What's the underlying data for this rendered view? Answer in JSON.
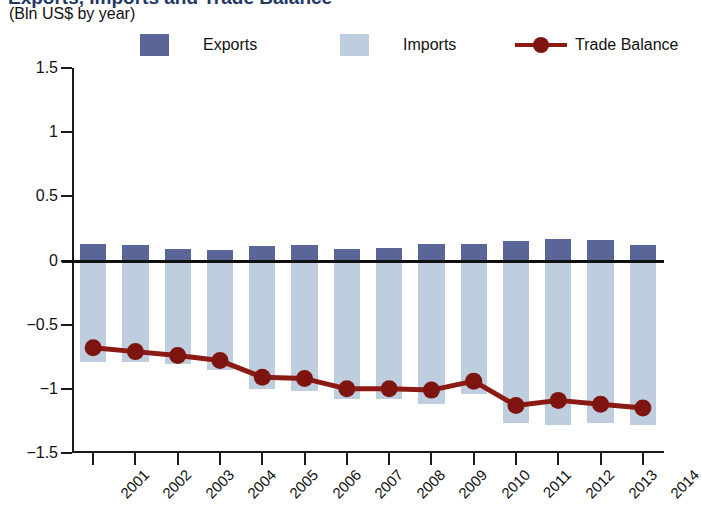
{
  "header": {
    "title": "Exports, Imports and Trade Balance",
    "subtitle": "(Bln US$ by year)"
  },
  "legend": {
    "exports_label": "Exports",
    "imports_label": "Imports",
    "balance_label": "Trade Balance"
  },
  "colors": {
    "exports": "#5b6698",
    "imports": "#bfcede",
    "balance": "#8b1a14",
    "axis": "#1a1a1a",
    "title": "#1f3864"
  },
  "chart_data": {
    "type": "bar",
    "title": "Exports, Imports and Trade Balance",
    "subtitle": "(Bln US$ by year)",
    "xlabel": "",
    "ylabel": "(Bln US$ by year)",
    "ylim": [
      -1.5,
      1.5
    ],
    "yticks": [
      1.5,
      1,
      0.5,
      0,
      -0.5,
      -1,
      -1.5
    ],
    "ytick_labels": [
      "1.5",
      "1",
      "0.5",
      "0",
      "−0.5",
      "−1",
      "−1.5"
    ],
    "grid": false,
    "legend_position": "top",
    "categories": [
      "2001",
      "2002",
      "2003",
      "2004",
      "2005",
      "2006",
      "2007",
      "2008",
      "2009",
      "2010",
      "2011",
      "2012",
      "2013",
      "2014"
    ],
    "series": [
      {
        "name": "Exports",
        "type": "bar",
        "color": "#5b6698",
        "values": [
          0.13,
          0.12,
          0.09,
          0.08,
          0.11,
          0.12,
          0.09,
          0.1,
          0.13,
          0.13,
          0.15,
          0.17,
          0.16,
          0.12
        ]
      },
      {
        "name": "Imports",
        "type": "bar",
        "color": "#bfcede",
        "values": [
          -0.79,
          -0.79,
          -0.81,
          -0.85,
          -1.0,
          -1.02,
          -1.08,
          -1.08,
          -1.12,
          -1.04,
          -1.27,
          -1.28,
          -1.27,
          -1.28
        ]
      },
      {
        "name": "Trade Balance",
        "type": "line",
        "color": "#8b1a14",
        "values": [
          -0.68,
          -0.71,
          -0.74,
          -0.78,
          -0.91,
          -0.92,
          -1.0,
          -1.0,
          -1.01,
          -0.94,
          -1.13,
          -1.09,
          -1.12,
          -1.15
        ]
      }
    ]
  }
}
